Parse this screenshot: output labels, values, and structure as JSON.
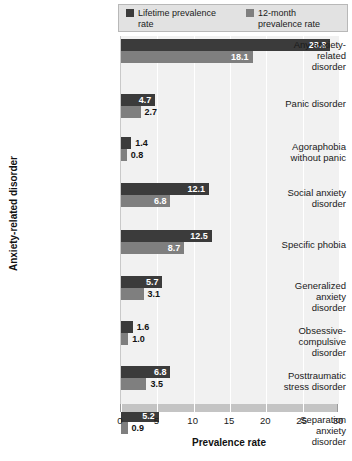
{
  "chart_data": {
    "type": "bar",
    "orientation": "horizontal",
    "title": "",
    "xlabel": "Prevalence rate",
    "ylabel": "Anxiety-related disorder",
    "xlim": [
      0,
      30
    ],
    "xticks": [
      0,
      5,
      10,
      15,
      20,
      25,
      30
    ],
    "grid": true,
    "legend_position": "top",
    "categories": [
      "Any anxiety-related disorder",
      "Panic disorder",
      "Agoraphobia without panic",
      "Social anxiety disorder",
      "Specific phobia",
      "Generalized anxiety disorder",
      "Obsessive-compulsive disorder",
      "Posttraumatic stress disorder",
      "Separation anxiety disorder"
    ],
    "category_lines": [
      [
        "Any anxiety-",
        "related",
        "disorder"
      ],
      [
        "Panic disorder"
      ],
      [
        "Agoraphobia",
        "without panic"
      ],
      [
        "Social anxiety",
        "disorder"
      ],
      [
        "Specific phobia"
      ],
      [
        "Generalized",
        "anxiety",
        "disorder"
      ],
      [
        "Obsessive-",
        "compulsive",
        "disorder"
      ],
      [
        "Posttraumatic",
        "stress disorder"
      ],
      [
        "Separation",
        "anxiety",
        "disorder"
      ]
    ],
    "series": [
      {
        "name": "Lifetime prevalence rate",
        "color": "#3b3b3b",
        "values": [
          28.8,
          4.7,
          1.4,
          12.1,
          12.5,
          5.7,
          1.6,
          6.8,
          5.2
        ],
        "labels": [
          "28.8",
          "4.7",
          "1.4",
          "12.1",
          "12.5",
          "5.7",
          "1.6",
          "6.8",
          "5.2"
        ]
      },
      {
        "name": "12-month prevalence rate",
        "color": "#7f7f7f",
        "values": [
          18.1,
          2.7,
          0.8,
          6.8,
          8.7,
          3.1,
          1.0,
          3.5,
          0.9
        ],
        "labels": [
          "18.1",
          "2.7",
          "0.8",
          "6.8",
          "8.7",
          "3.1",
          "1.0",
          "3.5",
          "0.9"
        ]
      }
    ]
  },
  "legend": {
    "entries": [
      {
        "label_line1": "Lifetime prevalence",
        "label_line2": "rate"
      },
      {
        "label_line1": "12-month",
        "label_line2": "prevalence rate"
      }
    ]
  },
  "axes": {
    "x_title": "Prevalence rate",
    "y_title": "Anxiety-related disorder",
    "x_tick_labels": [
      "0",
      "5",
      "10",
      "15",
      "20",
      "25",
      "30"
    ]
  },
  "colors": {
    "series_lifetime": "#3b3b3b",
    "series_twelve_month": "#7f7f7f",
    "plot_background": "#f1f1f1",
    "gridline": "#ffffff",
    "axis_strip": "#c4c4c4"
  }
}
